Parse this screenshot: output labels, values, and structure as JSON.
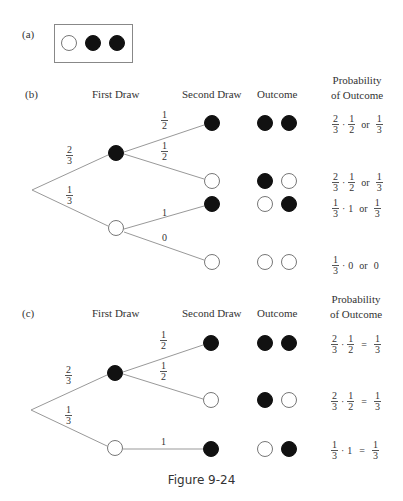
{
  "panel_a": {
    "label": "(a)",
    "urn": [
      "white",
      "black",
      "black"
    ]
  },
  "panel_b": {
    "label": "(b)",
    "headers": {
      "first_draw": "First Draw",
      "second_draw": "Second Draw",
      "outcome": "Outcome",
      "probability_line1": "Probability",
      "probability_line2": "of Outcome"
    },
    "first_branches": [
      {
        "color": "black",
        "prob": {
          "num": "2",
          "den": "3"
        }
      },
      {
        "color": "white",
        "prob": {
          "num": "1",
          "den": "3"
        }
      }
    ],
    "second_branches": [
      {
        "from": "black",
        "color": "black",
        "label": {
          "num": "1",
          "den": "2"
        }
      },
      {
        "from": "black",
        "color": "white",
        "label": {
          "num": "1",
          "den": "2"
        }
      },
      {
        "from": "white",
        "color": "black",
        "label_text": "1"
      },
      {
        "from": "white",
        "color": "white",
        "label_text": "0"
      }
    ],
    "outcomes": [
      {
        "colors": [
          "black",
          "black"
        ],
        "factor1": {
          "num": "2",
          "den": "3"
        },
        "dot": "·",
        "factor2": {
          "num": "1",
          "den": "2"
        },
        "op": "or",
        "result": {
          "num": "1",
          "den": "3"
        }
      },
      {
        "colors": [
          "black",
          "white"
        ],
        "factor1": {
          "num": "2",
          "den": "3"
        },
        "dot": "·",
        "factor2": {
          "num": "1",
          "den": "2"
        },
        "op": "or",
        "result": {
          "num": "1",
          "den": "3"
        }
      },
      {
        "colors": [
          "white",
          "black"
        ],
        "factor1": {
          "num": "1",
          "den": "3"
        },
        "dot": "·",
        "factor2_text": "1",
        "op": "or",
        "result": {
          "num": "1",
          "den": "3"
        }
      },
      {
        "colors": [
          "white",
          "white"
        ],
        "factor1": {
          "num": "1",
          "den": "3"
        },
        "dot": "·",
        "factor2_text": "0",
        "op": "or",
        "result_text": "0"
      }
    ]
  },
  "panel_c": {
    "label": "(c)",
    "headers": {
      "first_draw": "First Draw",
      "second_draw": "Second Draw",
      "outcome": "Outcome",
      "probability_line1": "Probability",
      "probability_line2": "of Outcome"
    },
    "first_branches": [
      {
        "color": "black",
        "prob": {
          "num": "2",
          "den": "3"
        }
      },
      {
        "color": "white",
        "prob": {
          "num": "1",
          "den": "3"
        }
      }
    ],
    "second_branches": [
      {
        "from": "black",
        "color": "black",
        "label": {
          "num": "1",
          "den": "2"
        }
      },
      {
        "from": "black",
        "color": "white",
        "label": {
          "num": "1",
          "den": "2"
        }
      },
      {
        "from": "white",
        "color": "black",
        "label_text": "1"
      }
    ],
    "outcomes": [
      {
        "colors": [
          "black",
          "black"
        ],
        "factor1": {
          "num": "2",
          "den": "3"
        },
        "dot": "·",
        "factor2": {
          "num": "1",
          "den": "2"
        },
        "op": "=",
        "result": {
          "num": "1",
          "den": "3"
        }
      },
      {
        "colors": [
          "black",
          "white"
        ],
        "factor1": {
          "num": "2",
          "den": "3"
        },
        "dot": "·",
        "factor2": {
          "num": "1",
          "den": "2"
        },
        "op": "=",
        "result": {
          "num": "1",
          "den": "3"
        }
      },
      {
        "colors": [
          "white",
          "black"
        ],
        "factor1": {
          "num": "1",
          "den": "3"
        },
        "dot": "·",
        "factor2_text": "1",
        "op": "=",
        "result": {
          "num": "1",
          "den": "3"
        }
      }
    ]
  },
  "caption": "Figure 9-24"
}
